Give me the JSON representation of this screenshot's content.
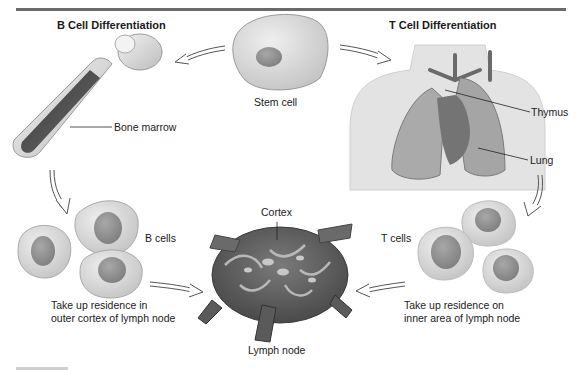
{
  "figure": {
    "left_title": "B Cell Differentiation",
    "right_title": "T Cell Differentiation",
    "labels": {
      "stem_cell": "Stem cell",
      "bone_marrow": "Bone marrow",
      "thymus": "Thymus",
      "lung": "Lung",
      "b_cells": "B cells",
      "t_cells": "T cells",
      "cortex": "Cortex",
      "lymph_node": "Lymph node",
      "b_residence_line1": "Take up residence in",
      "b_residence_line2": "outer cortex of lymph node",
      "t_residence_line1": "Take up residence on",
      "t_residence_line2": "inner area of lymph node"
    },
    "colors": {
      "rule": "#6a6a6a",
      "cell_body": "#dcdcdc",
      "nucleus": "#8c8c8c",
      "tissue_dark": "#5a5a5a",
      "tissue_mid": "#9a9a9a",
      "skin": "#e3e3e3"
    }
  }
}
